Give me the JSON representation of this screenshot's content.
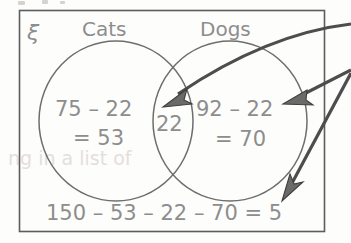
{
  "diagram": {
    "type": "venn-diagram",
    "universal_set_symbol": "ξ",
    "set_labels": {
      "left": "Cats",
      "right": "Dogs"
    },
    "regions": {
      "left_only": {
        "line1": "75 – 22",
        "line2": "= 53",
        "value": 53
      },
      "intersection": {
        "line1": "22",
        "value": 22
      },
      "right_only": {
        "line1": "92 – 22",
        "line2": "= 70",
        "value": 70
      },
      "outside": {
        "line1": "150 – 53 – 22 – 70 = 5",
        "value": 5
      }
    },
    "annotations": {
      "arrows": [
        {
          "name": "arrow-to-intersection",
          "target": "intersection",
          "style": "curved"
        },
        {
          "name": "arrow-to-right-set",
          "target": "right_only",
          "style": "straight"
        },
        {
          "name": "arrow-to-outside",
          "target": "outside",
          "style": "straight"
        }
      ]
    },
    "colors": {
      "ink": "#8d8d8d",
      "border": "#5d5d5d",
      "circle": "#6e6e6e",
      "arrow": "#4d4d4d",
      "arrow_fill": "#6a6a6a",
      "background": "#fdfdfc",
      "bleed_through": "#cfc6c4"
    },
    "bleed_through_text": "ng in a list of"
  }
}
